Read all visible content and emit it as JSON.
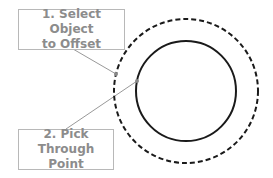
{
  "callouts": [
    {
      "step": "1",
      "line1": "1. Select Object",
      "line2": "to Offset"
    },
    {
      "step": "2",
      "line1": "2. Pick",
      "line2": "Through Point"
    }
  ],
  "colors": {
    "circle_stroke": "#1a1a1a",
    "leader_line": "#999999",
    "callout_border": "#b8b8b8",
    "callout_text": "#8c8c8c"
  },
  "geometry": {
    "center": [
      186,
      91
    ],
    "original_circle_radius": 50,
    "offset_circle_radius": 72
  }
}
